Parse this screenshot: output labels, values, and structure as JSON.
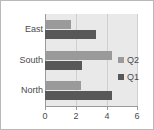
{
  "chart_data": {
    "type": "bar",
    "orientation": "horizontal",
    "title": "",
    "xlabel": "",
    "ylabel": "",
    "categories": [
      "North",
      "South",
      "East"
    ],
    "category_order_top_to_bottom": [
      "East",
      "South",
      "North"
    ],
    "series": [
      {
        "name": "Q1",
        "values": [
          4.3,
          2.4,
          3.3
        ],
        "color": "#585858"
      },
      {
        "name": "Q2",
        "values": [
          2.3,
          4.3,
          1.7
        ],
        "color": "#9a9a9a"
      }
    ],
    "legend_order": [
      "Q2",
      "Q1"
    ],
    "legend_position": "right",
    "xlim": [
      0,
      6
    ],
    "xticks": [
      0,
      2,
      4,
      6
    ],
    "xtick_labels": [
      "0",
      "2",
      "4",
      "6"
    ],
    "grid": true,
    "plot_background": "#e9e9e9",
    "axis_color": "#9a9a9a",
    "gridline_color": "#cfcfcf",
    "text_color": "#4a4a4a",
    "frame_border_color": "#b9b9b9"
  },
  "rows": [
    {
      "label": "East",
      "q2": 1.7,
      "q1": 3.3
    },
    {
      "label": "South",
      "q2": 4.3,
      "q1": 2.4
    },
    {
      "label": "North",
      "q2": 2.3,
      "q1": 4.3
    }
  ],
  "legend": {
    "items": [
      {
        "label": "Q2",
        "color": "#9a9a9a"
      },
      {
        "label": "Q1",
        "color": "#585858"
      }
    ]
  },
  "axis": {
    "ticks": [
      "0",
      "2",
      "4",
      "6"
    ]
  }
}
